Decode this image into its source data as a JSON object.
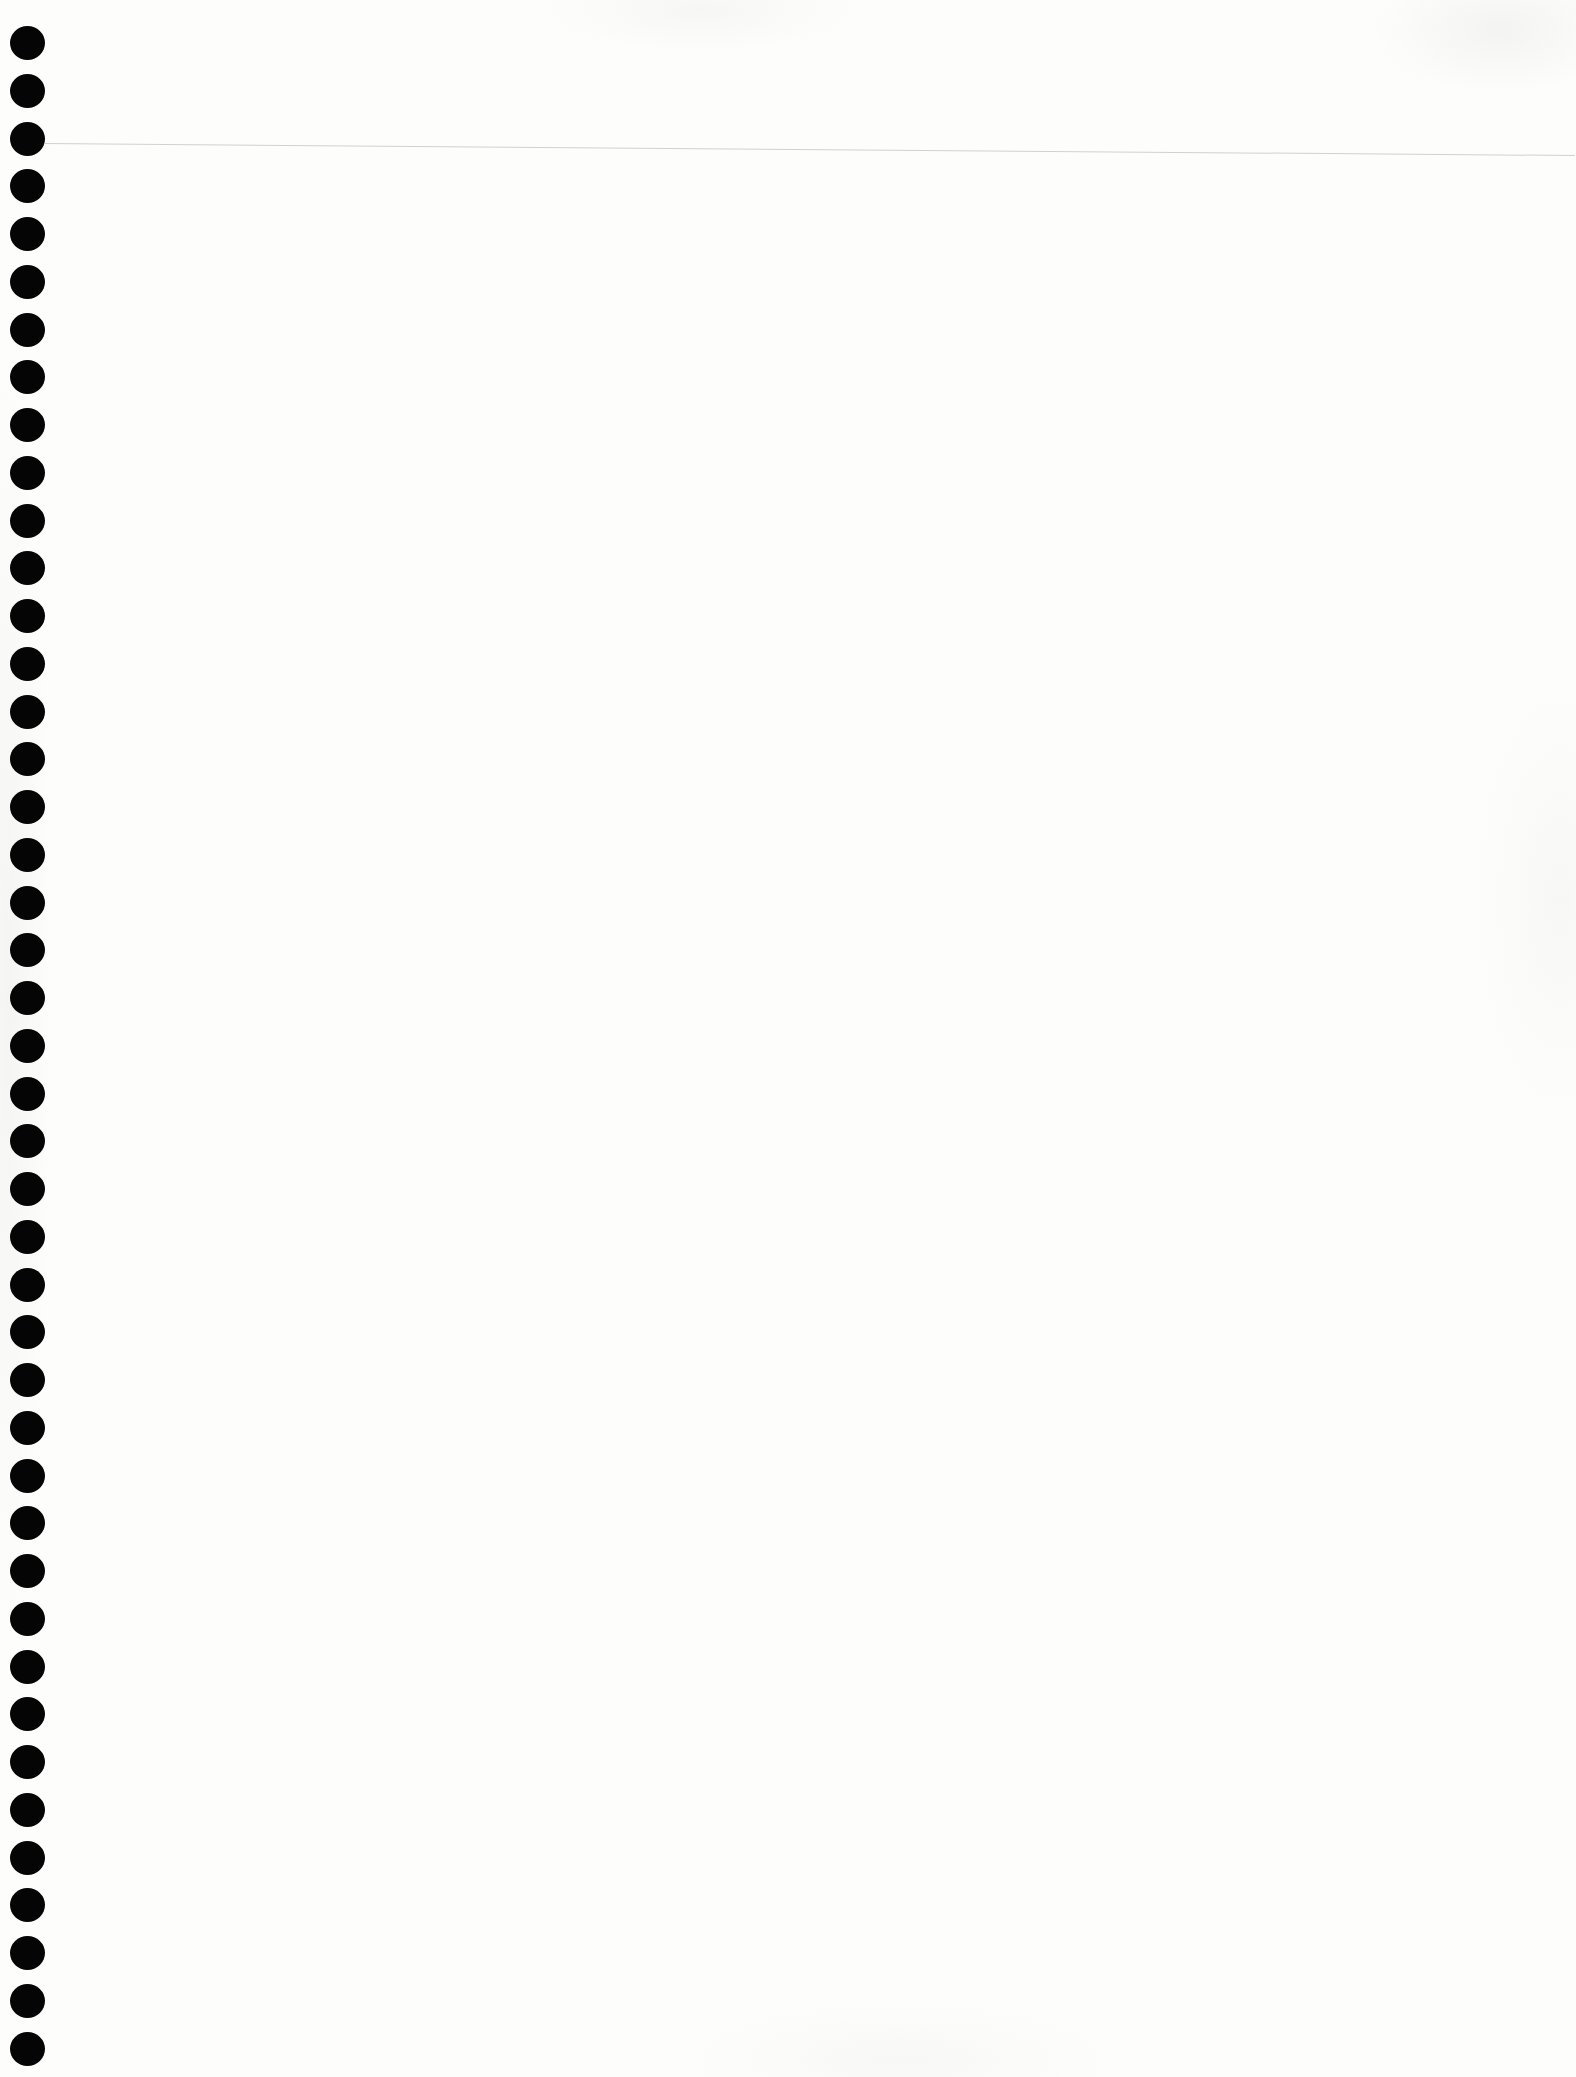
{
  "page": {
    "type": "blank-notebook-page",
    "background_color": "#fdfdfc",
    "rule_color": "#c9c9c9",
    "hole_color": "#050505",
    "hole_count": 43,
    "text": ""
  }
}
